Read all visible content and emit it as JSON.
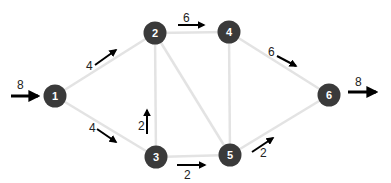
{
  "diagram": {
    "type": "flow-network",
    "nodes": [
      {
        "id": "1",
        "label": "1",
        "x": 55,
        "y": 96
      },
      {
        "id": "2",
        "label": "2",
        "x": 155,
        "y": 33
      },
      {
        "id": "3",
        "label": "3",
        "x": 156,
        "y": 157
      },
      {
        "id": "4",
        "label": "4",
        "x": 229,
        "y": 32
      },
      {
        "id": "5",
        "label": "5",
        "x": 230,
        "y": 155
      },
      {
        "id": "6",
        "label": "6",
        "x": 329,
        "y": 95
      }
    ],
    "edges": [
      {
        "from": "1",
        "to": "2",
        "flow": "4"
      },
      {
        "from": "1",
        "to": "3",
        "flow": "4"
      },
      {
        "from": "3",
        "to": "2",
        "flow": "2"
      },
      {
        "from": "2",
        "to": "4",
        "flow": "6"
      },
      {
        "from": "2",
        "to": "5",
        "flow": ""
      },
      {
        "from": "3",
        "to": "5",
        "flow": "2"
      },
      {
        "from": "4",
        "to": "5",
        "flow": ""
      },
      {
        "from": "4",
        "to": "6",
        "flow": "6"
      },
      {
        "from": "5",
        "to": "6",
        "flow": "2"
      }
    ],
    "source_inflow": {
      "node": "1",
      "value": "8"
    },
    "sink_outflow": {
      "node": "6",
      "value": "8"
    }
  },
  "labels": {
    "in": "8",
    "e12": "4",
    "e13": "4",
    "e32": "2",
    "e24": "6",
    "e35": "2",
    "e46": "6",
    "e56": "2",
    "out": "8"
  }
}
